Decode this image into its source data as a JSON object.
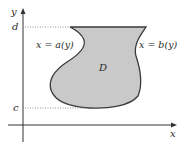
{
  "diagram": {
    "axes": {
      "x_label": "x",
      "y_label": "y",
      "color": "#333333"
    },
    "levels": {
      "top_label": "d",
      "bottom_label": "c",
      "dotted_color": "#888888"
    },
    "region": {
      "label": "D",
      "fill": "#c9c9c9",
      "stroke": "#3a3a3a"
    },
    "curves": {
      "left_label": "x = a(y)",
      "right_label": "x = b(y)"
    }
  }
}
